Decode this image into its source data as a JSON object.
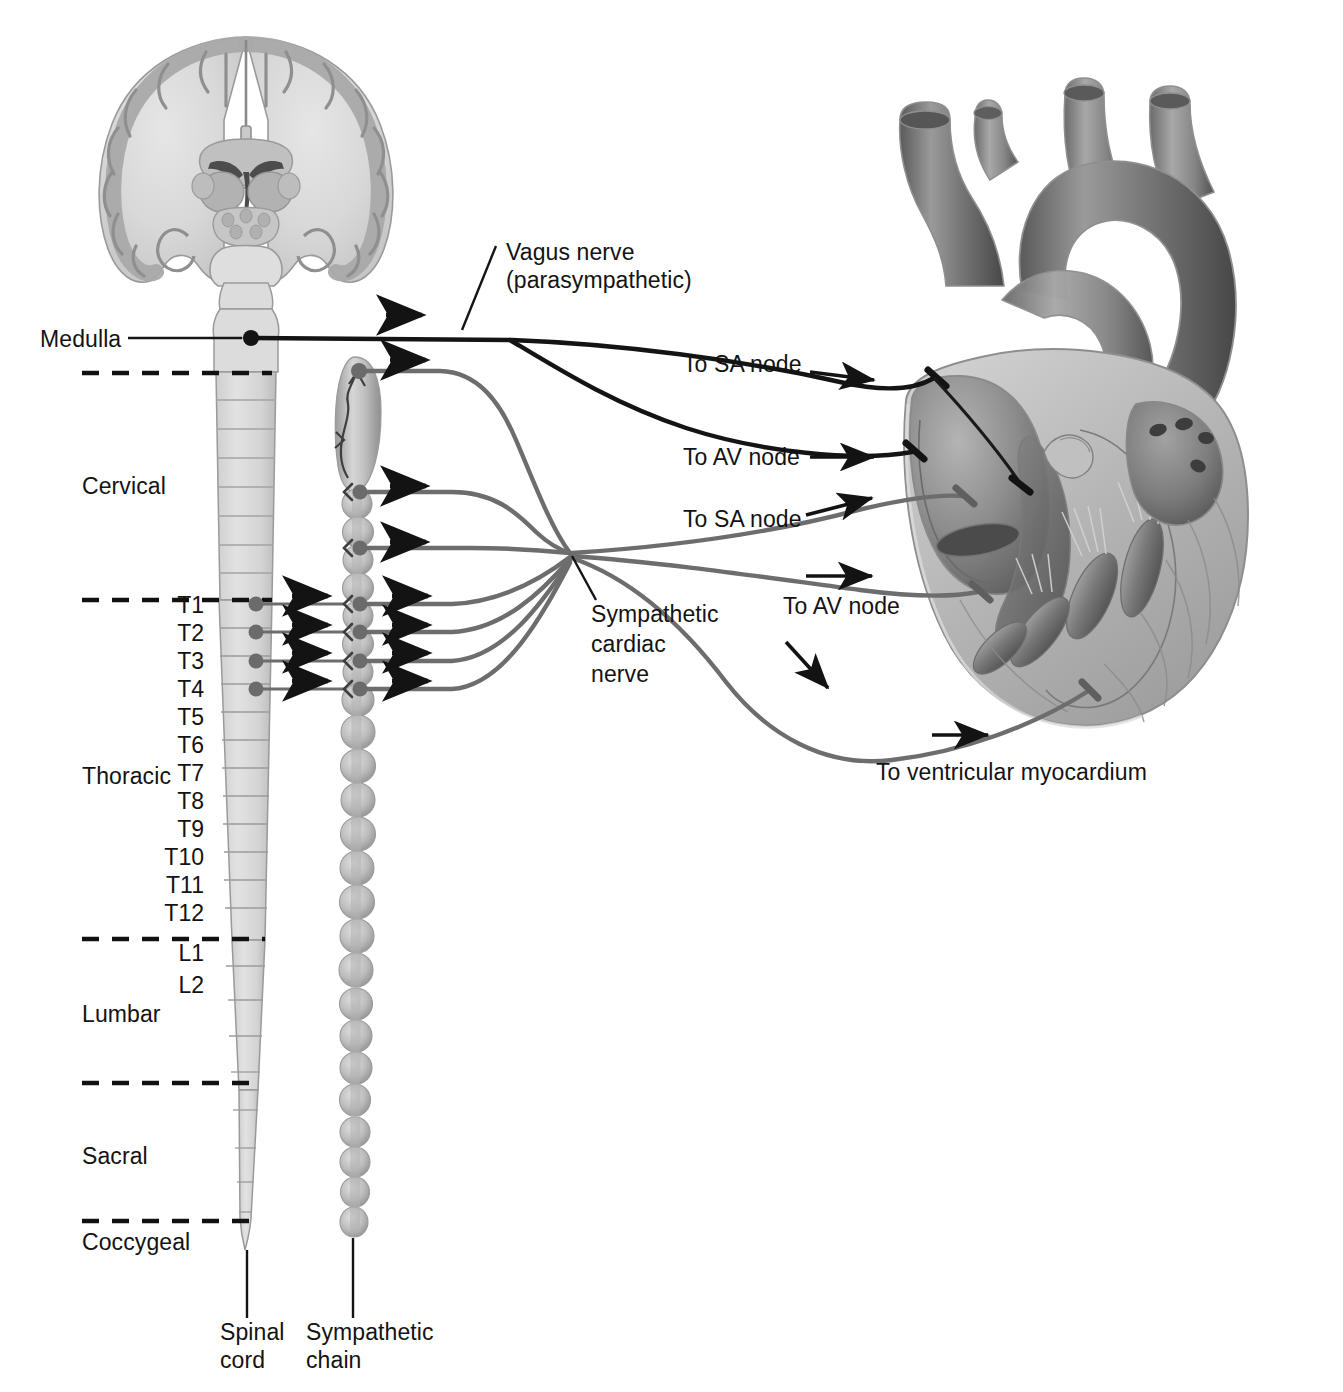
{
  "figure": {
    "type": "anatomical-diagram",
    "style": "grayscale medical illustration"
  },
  "palette": {
    "background": "#ffffff",
    "tissue_light": "#d9d9d9",
    "tissue_mid": "#a8a8a8",
    "tissue_dark": "#6e6e6e",
    "tissue_darkest": "#4a4a4a",
    "outline": "#8c8c8c",
    "parasympathetic_nerve": "#1a1a1a",
    "sympathetic_nerve": "#6b6b6b",
    "text": "#131313",
    "leader_line": "#1a1a1a",
    "dashed_divider": "#111111"
  },
  "labels": {
    "medulla": "Medulla",
    "vagus_nerve": "Vagus nerve",
    "vagus_nerve_sub": "(parasympathetic)",
    "sympathetic_cardiac_nerve_l1": "Sympathetic",
    "sympathetic_cardiac_nerve_l2": "cardiac",
    "sympathetic_cardiac_nerve_l3": "nerve",
    "spinal_cord_l1": "Spinal",
    "spinal_cord_l2": "cord",
    "sympathetic_chain_l1": "Sympathetic",
    "sympathetic_chain_l2": "chain",
    "to_sa_node_para": "To SA node",
    "to_av_node_para": "To AV node",
    "to_sa_node_symp": "To SA node",
    "to_av_node_symp": "To AV node",
    "to_ventricular_myocardium": "To ventricular myocardium"
  },
  "spinal_regions": [
    {
      "name": "Cervical",
      "label": "Cervical"
    },
    {
      "name": "Thoracic",
      "label": "Thoracic"
    },
    {
      "name": "Lumbar",
      "label": "Lumbar"
    },
    {
      "name": "Sacral",
      "label": "Sacral"
    },
    {
      "name": "Coccygeal",
      "label": "Coccygeal"
    }
  ],
  "spinal_segments": [
    {
      "id": "T1",
      "label": "T1",
      "has_neuron": true
    },
    {
      "id": "T2",
      "label": "T2",
      "has_neuron": true
    },
    {
      "id": "T3",
      "label": "T3",
      "has_neuron": true
    },
    {
      "id": "T4",
      "label": "T4",
      "has_neuron": true
    },
    {
      "id": "T5",
      "label": "T5",
      "has_neuron": false
    },
    {
      "id": "T6",
      "label": "T6",
      "has_neuron": false
    },
    {
      "id": "T7",
      "label": "T7",
      "has_neuron": false
    },
    {
      "id": "T8",
      "label": "T8",
      "has_neuron": false
    },
    {
      "id": "T9",
      "label": "T9",
      "has_neuron": false
    },
    {
      "id": "T10",
      "label": "T10",
      "has_neuron": false
    },
    {
      "id": "T11",
      "label": "T11",
      "has_neuron": false
    },
    {
      "id": "T12",
      "label": "T12",
      "has_neuron": false
    },
    {
      "id": "L1",
      "label": "L1",
      "has_neuron": false
    },
    {
      "id": "L2",
      "label": "L2",
      "has_neuron": false
    }
  ],
  "structures": [
    {
      "name": "brain-coronal-section",
      "description": "coronal section of cerebrum with cortex, white matter, ventricles, basal ganglia, brainstem"
    },
    {
      "name": "medulla-oblongata",
      "description": "brainstem continuing into spinal cord"
    },
    {
      "name": "spinal-cord",
      "description": "segmented spinal cord tapering to conus/filum"
    },
    {
      "name": "sympathetic-chain",
      "description": "paravertebral ganglionic chain, beaded, with elongated superior cervical ganglion"
    },
    {
      "name": "heart",
      "description": "heart in cutaway with aortic arch, great vessels, atria, ventricles, valves, papillary muscles"
    }
  ],
  "nerve_pathways": [
    {
      "name": "vagus-to-sa-node",
      "type": "parasympathetic",
      "origin": "Medulla",
      "target": "SA node",
      "label": "To SA node"
    },
    {
      "name": "vagus-to-av-node",
      "type": "parasympathetic",
      "origin": "Medulla",
      "target": "AV node",
      "label": "To AV node"
    },
    {
      "name": "sympathetic-to-sa-node",
      "type": "sympathetic",
      "origin": "T1-T4",
      "target": "SA node",
      "label": "To SA node"
    },
    {
      "name": "sympathetic-to-av-node",
      "type": "sympathetic",
      "origin": "T1-T4",
      "target": "AV node",
      "label": "To AV node"
    },
    {
      "name": "sympathetic-to-ventricle",
      "type": "sympathetic",
      "origin": "T1-T4",
      "target": "Ventricular myocardium",
      "label": "To ventricular myocardium"
    }
  ],
  "region_dividers": [
    "cervical-top",
    "cervical-thoracic",
    "thoracic-lumbar",
    "lumbar-sacral",
    "sacral-coccygeal"
  ]
}
